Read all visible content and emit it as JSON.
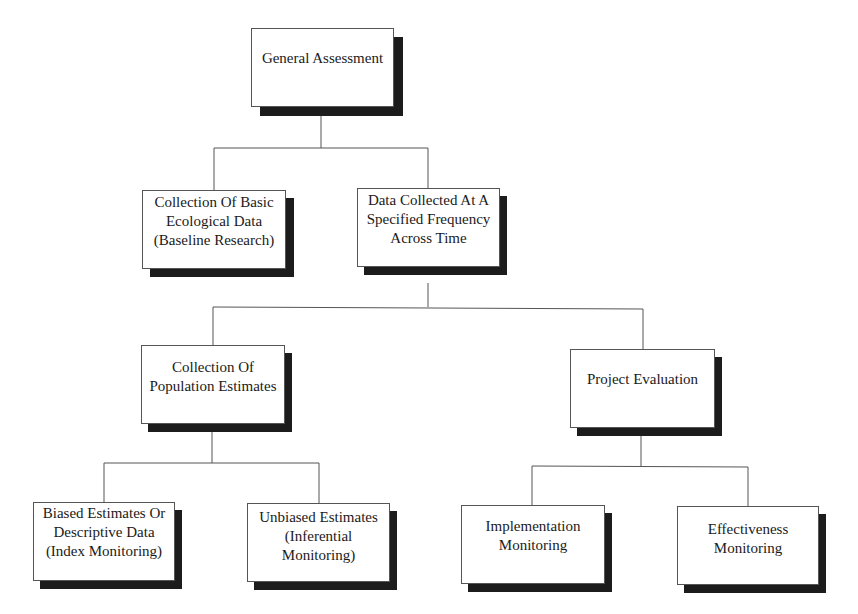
{
  "diagram": {
    "type": "hierarchy",
    "nodes": [
      {
        "id": "general",
        "lines": [
          "General Assessment"
        ]
      },
      {
        "id": "basic",
        "lines": [
          "Collection Of Basic",
          "Ecological Data",
          "(Baseline Research)"
        ]
      },
      {
        "id": "freq",
        "lines": [
          "Data Collected At A",
          "Specified Frequency",
          "Across Time"
        ]
      },
      {
        "id": "pop",
        "lines": [
          "Collection Of",
          "Population Estimates"
        ]
      },
      {
        "id": "proj",
        "lines": [
          "Project Evaluation"
        ]
      },
      {
        "id": "biased",
        "lines": [
          "Biased Estimates Or",
          "Descriptive Data",
          "(Index Monitoring)"
        ]
      },
      {
        "id": "unbiased",
        "lines": [
          "Unbiased Estimates",
          "(Inferential",
          "Monitoring)"
        ]
      },
      {
        "id": "impl",
        "lines": [
          "Implementation",
          "Monitoring"
        ]
      },
      {
        "id": "effect",
        "lines": [
          "Effectiveness",
          "Monitoring"
        ]
      }
    ],
    "edges": [
      [
        "general",
        "basic"
      ],
      [
        "general",
        "freq"
      ],
      [
        "freq",
        "pop"
      ],
      [
        "freq",
        "proj"
      ],
      [
        "pop",
        "biased"
      ],
      [
        "pop",
        "unbiased"
      ],
      [
        "proj",
        "impl"
      ],
      [
        "proj",
        "effect"
      ]
    ]
  }
}
